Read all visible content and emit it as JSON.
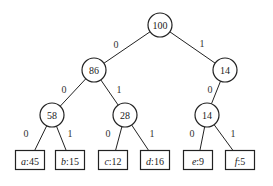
{
  "diagram": {
    "internal_nodes": [
      {
        "id": "root",
        "label": "100",
        "x": 160,
        "y": 25
      },
      {
        "id": "n86",
        "label": "86",
        "x": 94,
        "y": 70
      },
      {
        "id": "n14a",
        "label": "14",
        "x": 225,
        "y": 70
      },
      {
        "id": "n58",
        "label": "58",
        "x": 52,
        "y": 115
      },
      {
        "id": "n28",
        "label": "28",
        "x": 125,
        "y": 115
      },
      {
        "id": "n14b",
        "label": "14",
        "x": 207,
        "y": 115
      }
    ],
    "leaves": [
      {
        "id": "a",
        "symbol": "a",
        "freq": "45",
        "x": 30,
        "y": 160
      },
      {
        "id": "b",
        "symbol": "b",
        "freq": "15",
        "x": 70,
        "y": 160
      },
      {
        "id": "c",
        "symbol": "c",
        "freq": "12",
        "x": 113,
        "y": 160
      },
      {
        "id": "d",
        "symbol": "d",
        "freq": "16",
        "x": 155,
        "y": 160
      },
      {
        "id": "e",
        "symbol": "e",
        "freq": "9",
        "x": 198,
        "y": 160
      },
      {
        "id": "f",
        "symbol": "f",
        "freq": "5",
        "x": 240,
        "y": 160
      }
    ],
    "edges": [
      {
        "from": "root",
        "to": "n86",
        "bit": "0",
        "lx": 116,
        "ly": 44
      },
      {
        "from": "root",
        "to": "n14a",
        "bit": "1",
        "lx": 202,
        "ly": 43
      },
      {
        "from": "n86",
        "to": "n58",
        "bit": "0",
        "lx": 64,
        "ly": 89
      },
      {
        "from": "n86",
        "to": "n28",
        "bit": "1",
        "lx": 119,
        "ly": 89
      },
      {
        "from": "n14a",
        "to": "n14b",
        "bit": "0",
        "lx": 210,
        "ly": 89
      },
      {
        "from": "n58",
        "to": "a",
        "bit": "0",
        "lx": 26,
        "ly": 133
      },
      {
        "from": "n58",
        "to": "b",
        "bit": "1",
        "lx": 70,
        "ly": 133
      },
      {
        "from": "n28",
        "to": "c",
        "bit": "0",
        "lx": 108,
        "ly": 133
      },
      {
        "from": "n28",
        "to": "d",
        "bit": "1",
        "lx": 152,
        "ly": 133
      },
      {
        "from": "n14b",
        "to": "e",
        "bit": "0",
        "lx": 192,
        "ly": 133
      },
      {
        "from": "n14b",
        "to": "f",
        "bit": "1",
        "lx": 233,
        "ly": 133
      }
    ]
  }
}
